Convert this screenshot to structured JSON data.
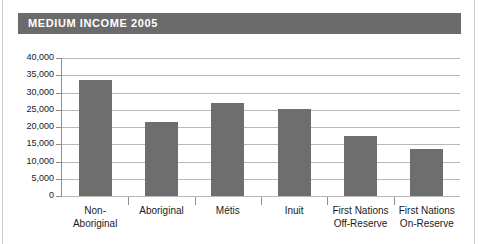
{
  "title": "MEDIUM INCOME 2005",
  "colors": {
    "banner": "#6b6b6b",
    "bar": "#6e6e6e",
    "gridline": "#b8b8b8",
    "axis": "#8d8d8d",
    "text": "#1a1a1a",
    "title_text": "#ffffff",
    "background": "#ffffff"
  },
  "chart_data": {
    "type": "bar",
    "title": "MEDIUM INCOME 2005",
    "xlabel": "",
    "ylabel": "",
    "ylim": [
      0,
      40000
    ],
    "ytick_values": [
      0,
      5000,
      10000,
      15000,
      20000,
      25000,
      30000,
      35000,
      40000
    ],
    "ytick_labels": [
      "0",
      "5,000",
      "10,000",
      "15,000",
      "20,000",
      "25,000",
      "30,000",
      "35,000",
      "40,000"
    ],
    "grid": true,
    "legend": false,
    "categories": [
      "Non-Aboriginal",
      "Aboriginal",
      "Métis",
      "Inuit",
      "First Nations Off-Reserve",
      "First Nations On-Reserve"
    ],
    "category_lines": [
      [
        "Non-",
        "Aboriginal"
      ],
      [
        "Aboriginal"
      ],
      [
        "Métis"
      ],
      [
        "Inuit"
      ],
      [
        "First Nations",
        "Off-Reserve"
      ],
      [
        "First Nations",
        "On-Reserve"
      ]
    ],
    "values": [
      33700,
      21500,
      27000,
      25200,
      17400,
      13600
    ]
  }
}
